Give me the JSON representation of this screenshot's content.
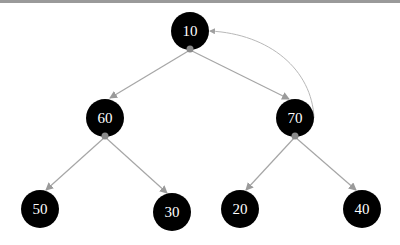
{
  "diagram": {
    "type": "binary-tree",
    "colors": {
      "node_fill": "#000000",
      "node_text": "#ffffff",
      "edge": "#a6a6a6",
      "port": "#8a8a8a",
      "top_bar": "#9a9a9a"
    },
    "nodes": [
      {
        "id": "n10",
        "label": "10",
        "cx": 190,
        "cy": 31,
        "r": 19
      },
      {
        "id": "n60",
        "label": "60",
        "cx": 105,
        "cy": 118,
        "r": 19
      },
      {
        "id": "n70",
        "label": "70",
        "cx": 295,
        "cy": 118,
        "r": 19
      },
      {
        "id": "n50",
        "label": "50",
        "cx": 40,
        "cy": 209,
        "r": 19
      },
      {
        "id": "n30",
        "label": "30",
        "cx": 172,
        "cy": 212,
        "r": 19
      },
      {
        "id": "n20",
        "label": "20",
        "cx": 240,
        "cy": 209,
        "r": 19
      },
      {
        "id": "n40",
        "label": "40",
        "cx": 362,
        "cy": 209,
        "r": 19
      }
    ],
    "edges": [
      {
        "from": "10",
        "to": "60"
      },
      {
        "from": "10",
        "to": "70"
      },
      {
        "from": "60",
        "to": "50"
      },
      {
        "from": "60",
        "to": "30"
      },
      {
        "from": "70",
        "to": "20"
      },
      {
        "from": "70",
        "to": "40"
      }
    ],
    "curved_edges": [
      {
        "from": "70",
        "to": "10"
      }
    ]
  }
}
